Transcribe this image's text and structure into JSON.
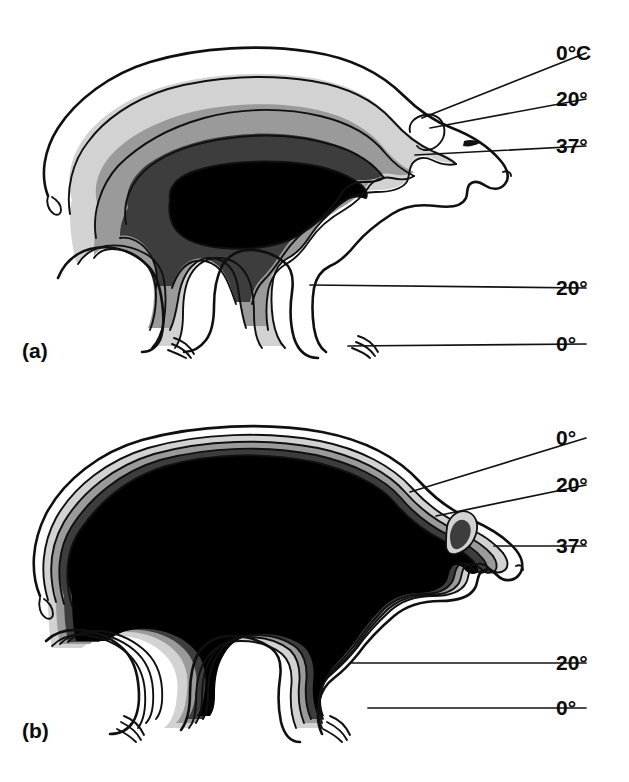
{
  "figure": {
    "background_color": "#ffffff",
    "width": 629,
    "height": 782
  },
  "panels": [
    {
      "id": "a",
      "label": "(a)",
      "label_x": 22,
      "label_y": 358,
      "description": "Polar bear cross-section with broad thermal gradient bands; well insulated",
      "labels": [
        {
          "id": "a-0C",
          "text": "0°C",
          "x": 556,
          "y": 58,
          "leader": "M 50,133 L 545,48"
        },
        {
          "id": "a-20",
          "text": "20°",
          "x": 556,
          "y": 104,
          "leader": "M 203,140 L 545,95"
        },
        {
          "id": "a-37",
          "text": "37°",
          "x": 556,
          "y": 151,
          "leader": "M 300,170 L 545,142"
        },
        {
          "id": "a-20b",
          "text": "20°",
          "x": 556,
          "y": 292,
          "leader": "M 318,278 L 545,283"
        },
        {
          "id": "a-0b",
          "text": "0°",
          "x": 556,
          "y": 349,
          "leader": "M 356,348 L 545,340"
        }
      ]
    },
    {
      "id": "b",
      "label": "(b)",
      "label_x": 22,
      "label_y": 738,
      "description": "Polar bear cross-section with warm core extending near the skin; poorly insulated",
      "labels": [
        {
          "id": "b-0C",
          "text": "0°",
          "x": 556,
          "y": 443,
          "leader": "M 410,495 L 545,433"
        },
        {
          "id": "b-20",
          "text": "20°",
          "x": 556,
          "y": 490,
          "leader": "M 430,510 L 545,480"
        },
        {
          "id": "b-37",
          "text": "37°",
          "x": 556,
          "y": 551,
          "leader": "M 492,545 L 545,542"
        },
        {
          "id": "b-20b",
          "text": "20°",
          "x": 556,
          "y": 668,
          "leader": "M 352,662 L 545,659"
        },
        {
          "id": "b-0b",
          "text": "0°",
          "x": 556,
          "y": 713,
          "leader": "M 370,705 L 545,705"
        }
      ]
    }
  ],
  "legend": {
    "zones": [
      {
        "name": "ambient-0C",
        "temperature": "0°C",
        "color": "#ffffff"
      },
      {
        "name": "outer-band-20",
        "temperature": "20°",
        "color": "#d2d2d2"
      },
      {
        "name": "mid-band-30",
        "temperature": "30°",
        "color": "#9a9a9a"
      },
      {
        "name": "inner-band-35",
        "temperature": "35°",
        "color": "#3d3d3d"
      },
      {
        "name": "core-37",
        "temperature": "37°",
        "color": "#000000"
      }
    ]
  },
  "colors": {
    "stroke": "#101010",
    "zone_light": "#d2d2d2",
    "zone_mid": "#9a9a9a",
    "zone_dark": "#3d3d3d",
    "zone_core": "#000000",
    "background": "#ffffff"
  }
}
